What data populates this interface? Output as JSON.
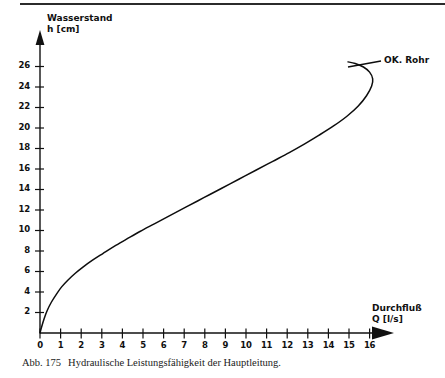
{
  "figure": {
    "caption_number": "Abb. 175",
    "caption_text": "Hydraulische Leistungsfähigkeit der Hauptleitung."
  },
  "chart_data": {
    "type": "line",
    "title": "",
    "subtitle": "",
    "xlabel": "Durchfluß",
    "xlabel_unit": "Q  [l/s]",
    "ylabel": "Wasserstand",
    "ylabel_unit": "h  [cm]",
    "xlim": [
      0,
      16.8
    ],
    "ylim": [
      0,
      27.5
    ],
    "grid": false,
    "legend_position": "none",
    "x_ticks": [
      "0",
      "1",
      "2",
      "3",
      "4",
      "5",
      "6",
      "7",
      "8",
      "9",
      "10",
      "11",
      "12",
      "13",
      "14",
      "15",
      "16"
    ],
    "y_ticks": [
      "2",
      "4",
      "6",
      "8",
      "10",
      "12",
      "14",
      "16",
      "18",
      "20",
      "22",
      "24",
      "26"
    ],
    "series": [
      {
        "name": "Abflusskurve Hauptleitung",
        "x": [
          0.0,
          0.08,
          0.2,
          0.35,
          0.55,
          0.8,
          1.05,
          1.35,
          1.7,
          2.1,
          2.55,
          3.05,
          3.6,
          4.2,
          4.85,
          5.55,
          6.3,
          7.1,
          7.95,
          8.8,
          9.65,
          10.5,
          11.3,
          12.1,
          12.85,
          13.55,
          14.25,
          14.9,
          15.45,
          15.85,
          16.1,
          16.15,
          16.0,
          15.7,
          15.3,
          14.95
        ],
        "y": [
          0.0,
          0.6,
          1.4,
          2.2,
          3.0,
          3.8,
          4.5,
          5.15,
          5.8,
          6.45,
          7.1,
          7.75,
          8.45,
          9.15,
          9.9,
          10.65,
          11.45,
          12.3,
          13.2,
          14.1,
          15.0,
          15.9,
          16.75,
          17.6,
          18.45,
          19.3,
          20.2,
          21.15,
          22.15,
          23.15,
          24.1,
          24.8,
          25.45,
          25.95,
          26.3,
          26.45
        ]
      }
    ],
    "annotations": [
      {
        "label": "OK. Rohr",
        "kind": "leader-line",
        "target_x": 15.0,
        "target_y": 26.4
      }
    ]
  },
  "icons": {
    "x_axis_arrow": "arrow-right-icon",
    "y_axis_arrow": "arrow-up-icon"
  }
}
